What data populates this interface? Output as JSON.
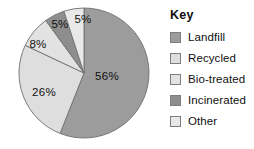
{
  "chart_data": {
    "type": "pie",
    "title": "",
    "legend_title": "Key",
    "legend_position": "right",
    "categories": [
      "Landfill",
      "Recycled",
      "Bio-treated",
      "Incinerated",
      "Other"
    ],
    "values": [
      56,
      26,
      8,
      5,
      5
    ],
    "value_labels": [
      "56%",
      "26%",
      "8%",
      "5%",
      "5%"
    ],
    "colors": [
      "#9c9c9c",
      "#dedede",
      "#e2e2e2",
      "#8e8e8e",
      "#e9e9e9"
    ],
    "start_angle_deg": 0,
    "direction": "clockwise",
    "units": "percent",
    "total": 100
  },
  "legend": {
    "title": "Key",
    "items": [
      {
        "label": "Landfill",
        "color": "#9c9c9c",
        "value": "56%"
      },
      {
        "label": "Recycled",
        "color": "#dedede",
        "value": "26%"
      },
      {
        "label": "Bio-treated",
        "color": "#e2e2e2",
        "value": "8%"
      },
      {
        "label": "Incinerated",
        "color": "#8e8e8e",
        "value": "5%"
      },
      {
        "label": "Other",
        "color": "#e9e9e9",
        "value": "5%"
      }
    ]
  },
  "pie": {
    "center_x": 84,
    "center_y": 73,
    "radius": 65,
    "slices": [
      {
        "name": "Landfill",
        "value": 56,
        "label": "56%",
        "color": "#9c9c9c",
        "label_x": 107,
        "label_y": 77
      },
      {
        "name": "Recycled",
        "value": 26,
        "label": "26%",
        "color": "#dedede",
        "label_x": 44,
        "label_y": 93
      },
      {
        "name": "Bio-treated",
        "value": 8,
        "label": "8%",
        "color": "#e2e2e2",
        "label_x": 38,
        "label_y": 45
      },
      {
        "name": "Incinerated",
        "value": 5,
        "label": "5%",
        "color": "#8e8e8e",
        "label_x": 60,
        "label_y": 25
      },
      {
        "name": "Other",
        "value": 5,
        "label": "5%",
        "color": "#e9e9e9",
        "label_x": 83,
        "label_y": 20
      }
    ]
  }
}
